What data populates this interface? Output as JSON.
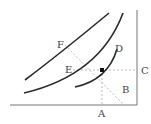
{
  "diagram": {
    "labels": {
      "A": "A",
      "B": "B",
      "C": "C",
      "D": "D",
      "E": "E",
      "F": "F"
    },
    "colors": {
      "curve": "#2a2a2a",
      "axis": "#555555",
      "dashed": "#bbbbbb",
      "point": "#111111",
      "label": "#444444"
    }
  }
}
